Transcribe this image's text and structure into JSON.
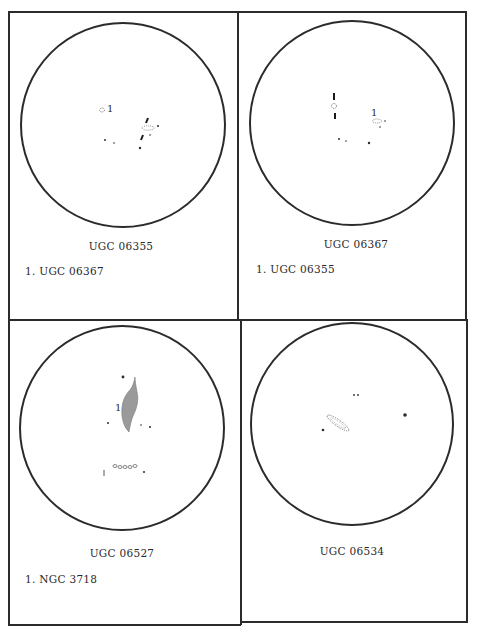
{
  "page": {
    "layout": "2x2 grid of finder-chart panels"
  },
  "panels": [
    {
      "id": "top-left",
      "title": "UGC 06355",
      "notes": [
        "1. UGC 06367"
      ],
      "field_marker_label": "1"
    },
    {
      "id": "top-right",
      "title": "UGC 06367",
      "notes": [
        "1. UGC 06355"
      ],
      "field_marker_label": "1"
    },
    {
      "id": "bottom-left",
      "title": "UGC 06527",
      "notes": [
        "1. NGC 3718"
      ],
      "field_marker_label": "1"
    },
    {
      "id": "bottom-right",
      "title": "UGC 06534",
      "notes": [],
      "field_marker_label": ""
    }
  ],
  "colors": {
    "ink": "#2b2b2b",
    "galaxy_fill": "#9a9a9a",
    "paper": "#ffffff"
  }
}
